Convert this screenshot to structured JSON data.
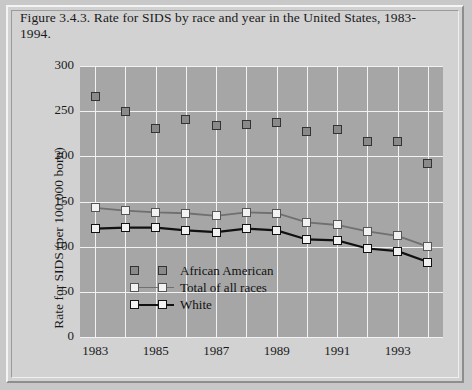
{
  "caption": "Figure 3.4.3. Rate for SIDS by race and year in the United States, 1983-1994.",
  "chart_data": {
    "type": "line",
    "title": "Figure 3.4.3. Rate for SIDS by race and year in the United States, 1983-1994.",
    "xlabel": "",
    "ylabel": "Rate for SIDS (per 100,000 born)",
    "x": [
      1983,
      1984,
      1985,
      1986,
      1987,
      1988,
      1989,
      1990,
      1991,
      1992,
      1993,
      1994
    ],
    "categories": [
      "1983",
      "1984",
      "1985",
      "1986",
      "1987",
      "1988",
      "1989",
      "1990",
      "1991",
      "1992",
      "1993",
      "1994"
    ],
    "xtick_labels": [
      "1983",
      "1985",
      "1987",
      "1989",
      "1991",
      "1993"
    ],
    "ytick_labels": [
      "0",
      "50",
      "100",
      "150",
      "200",
      "250",
      "300"
    ],
    "ylim": [
      0,
      300
    ],
    "xlim": [
      1982.5,
      1994.5
    ],
    "grid": true,
    "legend_position": "inside-lower-left",
    "series": [
      {
        "name": "African American",
        "marker": "filled-square",
        "color": "#8a8a8a",
        "line": false,
        "values": [
          266,
          250,
          231,
          241,
          234,
          235,
          238,
          228,
          230,
          216,
          216,
          192
        ]
      },
      {
        "name": "Total of all races",
        "marker": "open-square",
        "color": "#707070",
        "line": true,
        "values": [
          143,
          140,
          138,
          137,
          134,
          138,
          137,
          127,
          124,
          117,
          112,
          100
        ]
      },
      {
        "name": "White",
        "marker": "open-square",
        "color": "#111111",
        "line": true,
        "values": [
          120,
          121,
          121,
          118,
          116,
          120,
          118,
          108,
          107,
          98,
          95,
          83
        ]
      }
    ]
  },
  "legend": {
    "items": [
      {
        "label": "African American"
      },
      {
        "label": "Total of all races"
      },
      {
        "label": "White"
      }
    ]
  },
  "colors": {
    "plot_background": "#a6a6a6",
    "figure_background": "#d2d2d2",
    "gridline": "#f2f2f2",
    "african_american": "#8a8a8a",
    "total": "#707070",
    "white_series": "#111111"
  }
}
